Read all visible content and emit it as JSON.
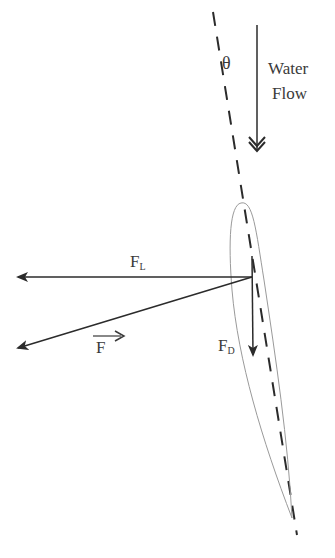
{
  "diagram": {
    "labels": {
      "angle": "θ",
      "water_flow_line1": "Water",
      "water_flow_line2": "Flow",
      "lift_force": "F",
      "lift_sub": "L",
      "drag_force": "F",
      "drag_sub": "D",
      "resultant_force": "F"
    },
    "colors": {
      "stroke": "#2b2b2b",
      "outline": "#9a9a9a",
      "text": "#3a3a3a"
    }
  }
}
